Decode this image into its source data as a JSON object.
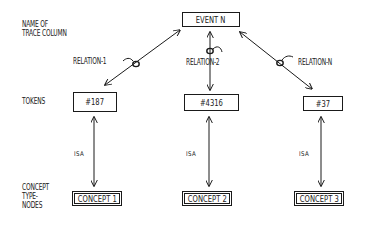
{
  "row_labels": {
    "trace_column": [
      "NAME OF",
      "TRACE COLUMN"
    ],
    "tokens": "TOKENS",
    "concept_type_nodes": [
      "CONCEPT",
      "TYPE-",
      "NODES"
    ]
  },
  "event": {
    "label": "EVENT N"
  },
  "relations": [
    {
      "label": "RELATION-1"
    },
    {
      "label": "RELATION-2"
    },
    {
      "label": "RELATION-N"
    }
  ],
  "tokens": [
    {
      "label": "#187"
    },
    {
      "label": "#4316"
    },
    {
      "label": "#37"
    }
  ],
  "isa_links": [
    {
      "label": "ISA"
    },
    {
      "label": "ISA"
    },
    {
      "label": "ISA"
    }
  ],
  "concepts": [
    {
      "label": "CONCEPT 1"
    },
    {
      "label": "CONCEPT 2"
    },
    {
      "label": "CONCEPT 3"
    }
  ],
  "colors": {
    "ink": "#1a1a1a",
    "background": "#ffffff"
  }
}
